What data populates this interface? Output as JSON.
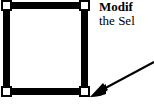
{
  "figure": {
    "type": "annotated-illustration",
    "background_color": "#ffffff",
    "ink_color": "#000000"
  },
  "selection_box": {
    "name": "selection-bounding-box",
    "border_color": "#000000",
    "fill_color": "#ffffff",
    "handle_fill": "#ffffff",
    "handle_border": "#000000",
    "handles": [
      {
        "position": "top-left"
      },
      {
        "position": "top-right"
      },
      {
        "position": "bottom-left"
      },
      {
        "position": "bottom-right"
      }
    ]
  },
  "callout": {
    "line1": "Modif",
    "line2": "the Sel",
    "text_color": "#000000",
    "arrow": {
      "name": "leader-arrow",
      "color": "#000000",
      "points_to": "bottom-right-handle"
    }
  }
}
